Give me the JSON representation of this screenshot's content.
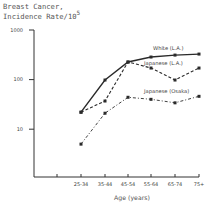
{
  "chart_data": {
    "type": "line",
    "title_line1": "Breast Cancer,",
    "title_line2": "Incidence Rate/10",
    "title_superscript": "5",
    "xlabel": "Age (years)",
    "ylabel": "Breast Cancer, Incidence Rate/10^5",
    "yscale": "log",
    "ylim": [
      1,
      1000
    ],
    "yticks": [
      {
        "value": 1000,
        "label": "1000"
      },
      {
        "value": 100,
        "label": "100"
      },
      {
        "value": 10,
        "label": "10"
      }
    ],
    "categories": [
      "25-34",
      "35-44",
      "45-54",
      "55-64",
      "65-74",
      "75+"
    ],
    "series": [
      {
        "name": "White (L.A.)",
        "style": "solid",
        "values": [
          22,
          98,
          226,
          285,
          312,
          327
        ]
      },
      {
        "name": "Japanese (L.A.)",
        "style": "dashed",
        "values": [
          22,
          37,
          226,
          171,
          98,
          171
        ]
      },
      {
        "name": "Japanese (Osaka)",
        "style": "dash-dot",
        "values": [
          5,
          21,
          44,
          40,
          34,
          46
        ]
      }
    ],
    "legend_position": "inline labels near line ends",
    "grid": false
  },
  "colors": {
    "line": "#2a2a2a",
    "axis": "#333333",
    "background": "#ffffff"
  }
}
